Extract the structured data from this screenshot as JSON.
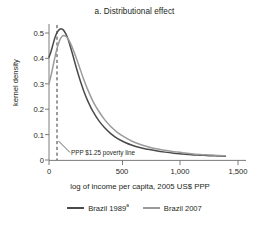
{
  "panel": {
    "title": "a.  Distributional effect"
  },
  "annotation": {
    "poverty_line_label": "PPP $1.25 poverty line"
  },
  "legend": {
    "entries": [
      {
        "label": "Brazil 1989",
        "superscript": "a",
        "color": "#4a4a4a"
      },
      {
        "label": "Brazil 2007",
        "superscript": "",
        "color": "#9b9b9b"
      }
    ]
  },
  "chart_data": {
    "type": "line",
    "title": "a.  Distributional effect",
    "xlabel": "log of income per capita, 2005 US$ PPP",
    "ylabel": "kernel density",
    "xlim": [
      0,
      1500
    ],
    "ylim": [
      0,
      0.55
    ],
    "xticks": [
      0,
      500,
      1000,
      1500
    ],
    "xticklabels": [
      "0",
      "500",
      "1,000",
      "1,500"
    ],
    "yticks": [
      0,
      0.1,
      0.2,
      0.3,
      0.4,
      0.5
    ],
    "yticklabels": [
      "0",
      "0.1",
      "0.2",
      "0.3",
      "0.4",
      "0.5"
    ],
    "grid": false,
    "legend_position": "bottom",
    "annotations": [
      {
        "text": "PPP $1.25 poverty line",
        "type": "vertical-dashed-line",
        "x": 57,
        "color": "#231f20"
      }
    ],
    "series": [
      {
        "name": "Brazil 1989",
        "color": "#4a4a4a",
        "x": [
          0,
          15,
          30,
          45,
          60,
          75,
          90,
          105,
          120,
          140,
          160,
          185,
          210,
          240,
          275,
          310,
          350,
          395,
          440,
          490,
          545,
          600,
          660,
          720,
          785,
          850,
          920,
          990,
          1060,
          1130,
          1200,
          1270,
          1340,
          1400
        ],
        "y": [
          0.405,
          0.425,
          0.452,
          0.478,
          0.498,
          0.51,
          0.516,
          0.515,
          0.508,
          0.49,
          0.463,
          0.42,
          0.375,
          0.325,
          0.273,
          0.23,
          0.19,
          0.155,
          0.128,
          0.104,
          0.084,
          0.07,
          0.058,
          0.049,
          0.042,
          0.036,
          0.031,
          0.027,
          0.024,
          0.021,
          0.019,
          0.017,
          0.016,
          0.015
        ]
      },
      {
        "name": "Brazil 2007",
        "color": "#9b9b9b",
        "x": [
          0,
          15,
          30,
          45,
          60,
          75,
          90,
          105,
          120,
          140,
          160,
          185,
          210,
          240,
          275,
          310,
          350,
          395,
          440,
          490,
          545,
          600,
          660,
          720,
          785,
          850,
          920,
          990,
          1060,
          1130,
          1200,
          1270,
          1340,
          1400
        ],
        "y": [
          0.3,
          0.33,
          0.365,
          0.4,
          0.432,
          0.458,
          0.477,
          0.487,
          0.49,
          0.484,
          0.47,
          0.443,
          0.41,
          0.368,
          0.318,
          0.274,
          0.23,
          0.192,
          0.16,
          0.132,
          0.108,
          0.09,
          0.074,
          0.062,
          0.052,
          0.044,
          0.038,
          0.033,
          0.029,
          0.025,
          0.022,
          0.02,
          0.018,
          0.017
        ]
      }
    ]
  }
}
